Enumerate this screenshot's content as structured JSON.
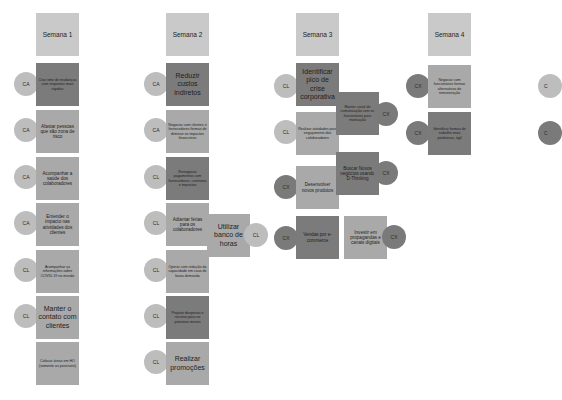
{
  "columns": [
    {
      "header": "Semana 1",
      "items": [
        {
          "text": "Criar time de mudanças com respostas mais rápidas",
          "tag": "CA"
        },
        {
          "text": "Afastar pessoas que são zona de risco",
          "tag": "CA"
        },
        {
          "text": "Acompanhar a saúde dos colaboradores",
          "tag": "CA"
        },
        {
          "text": "Entender o impacto nas atividades dos clientes",
          "tag": "CA"
        },
        {
          "text": "Acompanhar as informações sobre COVID-19 no mundo",
          "tag": "CL"
        },
        {
          "text": "Manter o contato com clientes",
          "tag": "CL"
        },
        {
          "text": "Colocar áreas em HO (somente as possíveis)",
          "tag": ""
        }
      ]
    },
    {
      "header": "Semana 2",
      "items": [
        {
          "text": "Reduzir custos indiretos",
          "tag": "CA"
        },
        {
          "text": "Negociar com clientes e fornecedores formas de diminuir os impactos financeiros",
          "tag": "CA"
        },
        {
          "text": "Renegociar pagamentos com fornecedores, contratos e impostos",
          "tag": "CL"
        },
        {
          "text": "Adiantar férias para os colaboradores",
          "tag": "CL"
        },
        {
          "text": "Utilizar banco de horas",
          "tag": "CL"
        },
        {
          "text": "Operar com redução da capacidade em caso de baixa demanda",
          "tag": "CL"
        },
        {
          "text": "Projetar despesas e receitas para os próximos meses",
          "tag": "CL"
        },
        {
          "text": "Realizar promoções",
          "tag": "CL"
        }
      ]
    },
    {
      "header": "Semana 3",
      "items": [
        {
          "text": "Identificar pico de crise corporativa",
          "tag": "CL"
        },
        {
          "text": "Manter canal de comunicação com os funcionários para motivação",
          "tag": "CX"
        },
        {
          "text": "Realizar atividades para engajamento dos colaboradores",
          "tag": "CL"
        },
        {
          "text": "Buscar Novos negócios usando D-Thinking",
          "tag": "CX"
        },
        {
          "text": "Desenvolver novos produtos",
          "tag": "CX"
        },
        {
          "text": "Vendas por e-commerce",
          "tag": "CX"
        },
        {
          "text": "Investir em propagandas e canais digitais",
          "tag": "CX"
        }
      ]
    },
    {
      "header": "Semana 4",
      "items": [
        {
          "text": "Negociar com funcionários formas alternativas de remuneração",
          "tag": "CX"
        },
        {
          "text": "Identificar formas de trabalho mais produtivas, ágil",
          "tag": "CX"
        }
      ]
    }
  ],
  "offscreen_badges": [
    "C",
    "C"
  ]
}
